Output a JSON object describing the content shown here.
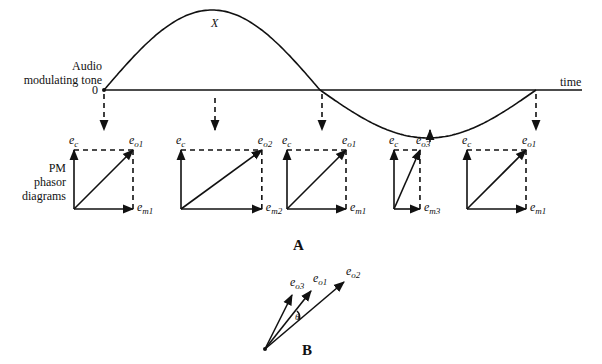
{
  "figure": {
    "top_labels": {
      "audio_line1": "Audio",
      "audio_line2": "modulating tone",
      "zero": "0",
      "peak": "X",
      "time_axis": "time"
    },
    "side_label": {
      "line1": "PM",
      "line2": "phasor",
      "line3": "diagrams"
    },
    "part_a_label": "A",
    "part_b_label": "B",
    "phasor_diagrams": [
      {
        "carrier": "e",
        "carrier_sub": "c",
        "output": "e",
        "output_sub": "o1",
        "mod": "e",
        "mod_sub": "m1",
        "mod_ratio": 1.0
      },
      {
        "carrier": "e",
        "carrier_sub": "c",
        "output": "e",
        "output_sub": "o2",
        "mod": "e",
        "mod_sub": "m2",
        "mod_ratio": 1.37
      },
      {
        "carrier": "e",
        "carrier_sub": "c",
        "output": "e",
        "output_sub": "o1",
        "mod": "e",
        "mod_sub": "m1",
        "mod_ratio": 1.0
      },
      {
        "carrier": "e",
        "carrier_sub": "c",
        "output": "e",
        "output_sub": "o3",
        "mod": "e",
        "mod_sub": "m3",
        "mod_ratio": 0.44
      },
      {
        "carrier": "e",
        "carrier_sub": "c",
        "output": "e",
        "output_sub": "o1",
        "mod": "e",
        "mod_sub": "m1",
        "mod_ratio": 1.0
      }
    ],
    "part_b_vectors": [
      {
        "name": "e",
        "sub": "o3"
      },
      {
        "name": "e",
        "sub": "o1"
      },
      {
        "name": "e",
        "sub": "o2"
      }
    ],
    "angle_symbol": "θ"
  }
}
